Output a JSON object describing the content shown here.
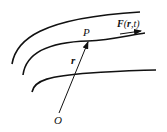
{
  "diagram": {
    "type": "vector field lines with position vector",
    "labels": {
      "point": "P",
      "field_prefix": "F",
      "field_args": "(r,t)",
      "field_arg_r": "r",
      "field_arg_sep": ",",
      "field_arg_t": "t",
      "position_vector": "r",
      "origin": "O"
    },
    "field_lines": 3,
    "colors": {
      "line": "#111111",
      "background": "#ffffff"
    }
  }
}
